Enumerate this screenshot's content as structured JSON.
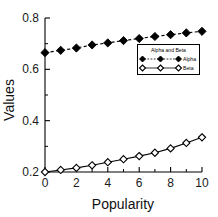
{
  "chart_data": {
    "type": "line",
    "title": "",
    "xlabel": "Popularity",
    "ylabel": "Values",
    "xlim": [
      0,
      10
    ],
    "ylim": [
      0.2,
      0.8
    ],
    "x": [
      0,
      1,
      2,
      3,
      4,
      5,
      6,
      7,
      8,
      9,
      10
    ],
    "xticks": [
      0,
      2,
      4,
      6,
      8,
      10
    ],
    "xticklabels": [
      "0",
      "2",
      "4",
      "6",
      "8",
      "10"
    ],
    "xminorticks": [
      1,
      3,
      5,
      7,
      9
    ],
    "yticks": [
      0.2,
      0.4,
      0.6,
      0.8
    ],
    "yticklabels": [
      "0.2",
      "0.4",
      "0.6",
      "0.8"
    ],
    "yminorticks": [
      0.3,
      0.5,
      0.7
    ],
    "grid": false,
    "legend": {
      "position": "center-right",
      "title": "Alpha and Beta",
      "entries": [
        {
          "label": "Alpha",
          "marker": "filled-diamond",
          "line": "dashed"
        },
        {
          "label": "Beta",
          "marker": "open-diamond",
          "line": "solid"
        }
      ]
    },
    "series": [
      {
        "name": "Alpha",
        "marker": "filled-diamond",
        "linestyle": "dashed",
        "color": "#000000",
        "values": [
          0.665,
          0.674,
          0.683,
          0.695,
          0.703,
          0.712,
          0.72,
          0.728,
          0.735,
          0.742,
          0.748
        ]
      },
      {
        "name": "Beta",
        "marker": "open-diamond",
        "linestyle": "solid",
        "color": "#000000",
        "values": [
          0.2,
          0.208,
          0.216,
          0.226,
          0.238,
          0.25,
          0.262,
          0.275,
          0.292,
          0.313,
          0.335
        ]
      }
    ]
  }
}
